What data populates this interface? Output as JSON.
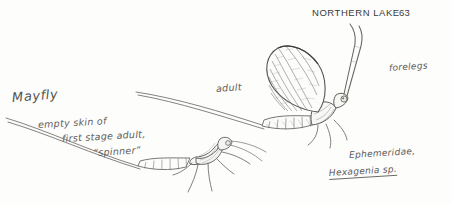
{
  "page": {
    "background_color": "#fdfdfc",
    "ink_color": "#5d5c59",
    "header": {
      "title": "NORTHERN LAKE",
      "page_number": "63"
    }
  },
  "labels": {
    "mayfly": "Mayfly",
    "empty_skin_line1": "empty skin of",
    "empty_skin_line2": "first stage adult,",
    "empty_skin_line3": "“spinner”",
    "adult": "adult",
    "forelegs": "forelegs",
    "family": "Ephemeridae,",
    "genus": "Hexagenia",
    "species_abbrev": "sp."
  },
  "illustrations": {
    "adult_mayfly": "winged-adult-mayfly-drawing",
    "shed_skin": "exuvia-spinner-skin-drawing"
  }
}
